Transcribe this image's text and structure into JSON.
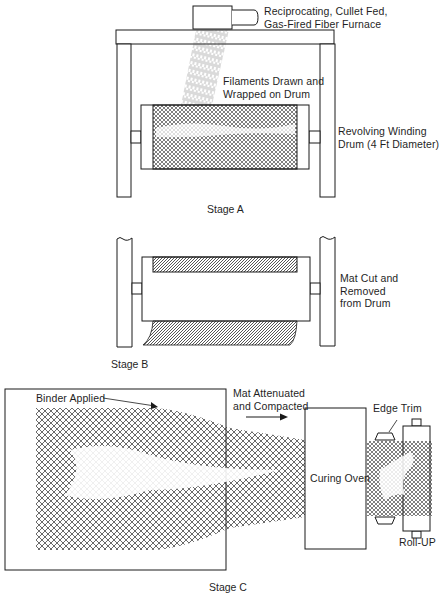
{
  "colors": {
    "line": "#1a1a1a",
    "mesh": "#2a2a2a",
    "background": "#ffffff"
  },
  "stage_a": {
    "caption": "Stage A",
    "labels": {
      "furnace_line1": "Reciprocating, Cullet Fed,",
      "furnace_line2": "Gas-Fired Fiber Furnace",
      "filaments_line1": "Filaments Drawn and",
      "filaments_line2": "Wrapped on Drum",
      "drum_line1": "Revolving Winding",
      "drum_line2": "Drum (4 Ft Diameter)"
    }
  },
  "stage_b": {
    "caption": "Stage B",
    "labels": {
      "mat_line1": "Mat Cut and",
      "mat_line2": "Removed",
      "mat_line3": "from Drum"
    }
  },
  "stage_c": {
    "caption": "Stage C",
    "labels": {
      "binder": "Binder Applied",
      "attenuated_line1": "Mat Attenuated",
      "attenuated_line2": "and Compacted",
      "oven": "Curing Oven",
      "edge_trim": "Edge Trim",
      "rollup": "Roll-UP"
    }
  }
}
